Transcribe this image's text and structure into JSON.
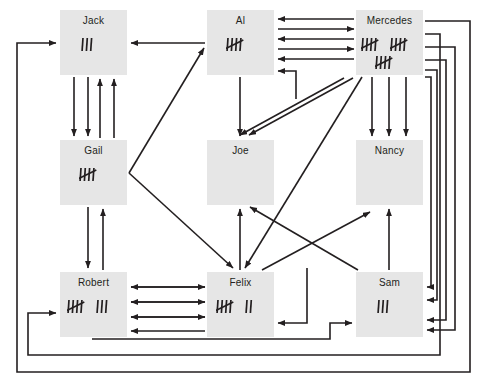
{
  "diagram": {
    "background": "#ffffff",
    "node_fill": "#e6e6e6",
    "edge_color": "#231f20",
    "nodes": [
      {
        "id": "jack",
        "label": "Jack",
        "tally_count": 3,
        "tally_rows": [
          3
        ],
        "x": 60,
        "y": 10,
        "w": 67,
        "h": 65
      },
      {
        "id": "al",
        "label": "Al",
        "tally_count": 5,
        "tally_rows": [
          5
        ],
        "x": 207,
        "y": 10,
        "w": 67,
        "h": 65
      },
      {
        "id": "mercedes",
        "label": "Mercedes",
        "tally_count": 15,
        "tally_rows": [
          5,
          5,
          5
        ],
        "x": 356,
        "y": 10,
        "w": 67,
        "h": 65
      },
      {
        "id": "gail",
        "label": "Gail",
        "tally_count": 5,
        "tally_rows": [
          5
        ],
        "x": 60,
        "y": 140,
        "w": 67,
        "h": 65
      },
      {
        "id": "joe",
        "label": "Joe",
        "tally_count": 0,
        "tally_rows": [],
        "x": 207,
        "y": 140,
        "w": 67,
        "h": 65
      },
      {
        "id": "nancy",
        "label": "Nancy",
        "tally_count": 0,
        "tally_rows": [],
        "x": 356,
        "y": 140,
        "w": 67,
        "h": 65
      },
      {
        "id": "robert",
        "label": "Robert",
        "tally_count": 8,
        "tally_rows": [
          5,
          3
        ],
        "x": 60,
        "y": 272,
        "w": 67,
        "h": 65
      },
      {
        "id": "felix",
        "label": "Felix",
        "tally_count": 7,
        "tally_rows": [
          5,
          2
        ],
        "x": 207,
        "y": 272,
        "w": 67,
        "h": 65
      },
      {
        "id": "sam",
        "label": "Sam",
        "tally_count": 3,
        "tally_rows": [
          3
        ],
        "x": 356,
        "y": 272,
        "w": 67,
        "h": 65
      }
    ],
    "edges": [
      {
        "from": "al",
        "to": "jack",
        "count": 1,
        "style": "horizontal"
      },
      {
        "from": "jack",
        "to": "gail",
        "count": 2,
        "style": "vertical-down"
      },
      {
        "from": "gail",
        "to": "jack",
        "count": 2,
        "style": "vertical-up"
      },
      {
        "from": "gail",
        "to": "al",
        "count": 1,
        "style": "diagonal"
      },
      {
        "from": "gail",
        "to": "felix",
        "count": 1,
        "style": "diagonal"
      },
      {
        "from": "gail",
        "to": "robert",
        "count": 1,
        "style": "vertical-down"
      },
      {
        "from": "robert",
        "to": "gail",
        "count": 1,
        "style": "vertical-up"
      },
      {
        "from": "al",
        "to": "mercedes",
        "count": 3,
        "style": "horizontal"
      },
      {
        "from": "mercedes",
        "to": "al",
        "count": 3,
        "style": "horizontal"
      },
      {
        "from": "al",
        "to": "joe",
        "count": 1,
        "style": "vertical-down"
      },
      {
        "from": "mercedes",
        "to": "joe",
        "count": 2,
        "style": "diagonal"
      },
      {
        "from": "mercedes",
        "to": "nancy",
        "count": 3,
        "style": "vertical-down"
      },
      {
        "from": "mercedes",
        "to": "felix",
        "count": 1,
        "style": "diagonal"
      },
      {
        "from": "mercedes",
        "to": "al",
        "count": 1,
        "style": "routed-bottom"
      },
      {
        "from": "mercedes",
        "to": "sam",
        "count": 4,
        "style": "routed-right"
      },
      {
        "from": "mercedes",
        "to": "jack",
        "count": 1,
        "style": "routed-left"
      },
      {
        "from": "mercedes",
        "to": "robert",
        "count": 1,
        "style": "routed-left"
      },
      {
        "from": "felix",
        "to": "joe",
        "count": 1,
        "style": "vertical-up"
      },
      {
        "from": "felix",
        "to": "nancy",
        "count": 1,
        "style": "diagonal"
      },
      {
        "from": "robert",
        "to": "felix",
        "count": 2,
        "style": "horizontal"
      },
      {
        "from": "felix",
        "to": "robert",
        "count": 2,
        "style": "horizontal"
      },
      {
        "from": "robert",
        "to": "sam",
        "count": 1,
        "style": "routed-bottom"
      },
      {
        "from": "sam",
        "to": "felix",
        "count": 1,
        "style": "routed"
      },
      {
        "from": "sam",
        "to": "nancy",
        "count": 1,
        "style": "vertical-up"
      },
      {
        "from": "sam",
        "to": "joe",
        "count": 1,
        "style": "diagonal"
      }
    ]
  }
}
